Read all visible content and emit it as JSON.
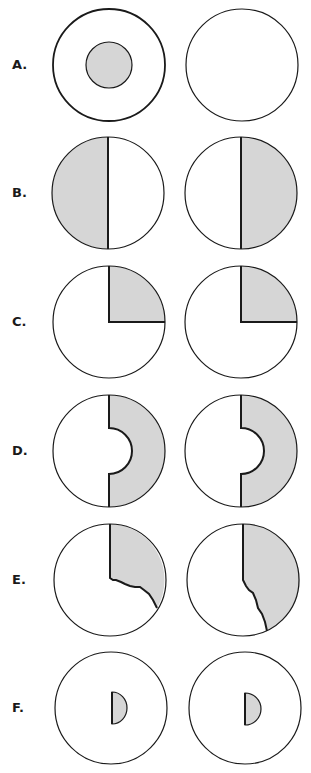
{
  "colors": {
    "fill": "#d6d6d6",
    "stroke": "#1a1a1a",
    "background": "#ffffff"
  },
  "rows": [
    {
      "label": "A.",
      "cy": 65,
      "description": "Left: circle with shaded concentric inner disc; Right: empty circle"
    },
    {
      "label": "B.",
      "cy": 193,
      "description": "Left: left half shaded; Right: right half shaded"
    },
    {
      "label": "C.",
      "cy": 322,
      "description": "Both: upper-right quadrant shaded"
    },
    {
      "label": "D.",
      "cy": 451,
      "description": "Both: right half annulus shaded with semicircular inner cutout"
    },
    {
      "label": "E.",
      "cy": 580,
      "description": "Left: upper-right sector with jagged lower edge shaded; Right: larger right region with jagged edge shaded"
    },
    {
      "label": "F.",
      "cy": 708,
      "description": "Both: small shaded half-disc near center"
    }
  ]
}
